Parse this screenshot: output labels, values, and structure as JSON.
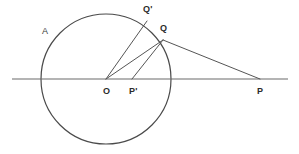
{
  "figure": {
    "background_color": "#ffffff",
    "stroke_color": "#555555",
    "circle_color": "#4a4a4a",
    "axis_color": "#6b6b6b",
    "label_color": "#2b2b2b"
  },
  "labels": {
    "circle_label": "A",
    "center": "O",
    "inverse_point": "P'",
    "exterior_point": "P",
    "tangent_point": "Q",
    "upper_point": "Q'"
  },
  "chart_data": {
    "type": "diagram",
    "xlabel": "",
    "ylabel": "",
    "xlim": [
      0,
      299
    ],
    "ylim": [
      0,
      154
    ],
    "grid": false,
    "legend": "none",
    "circles": [
      {
        "name": "A",
        "center_label": "O",
        "cx": 106,
        "cy": 79,
        "r": 65,
        "stroke": "#4a4a4a"
      }
    ],
    "points": [
      {
        "label": "A",
        "x": 48,
        "y": 35,
        "kind": "circle-name",
        "label_dx": -6,
        "label_dy": -4
      },
      {
        "label": "O",
        "x": 106,
        "y": 79,
        "kind": "center",
        "label_dx": -3,
        "label_dy": 12
      },
      {
        "label": "P'",
        "x": 132,
        "y": 79,
        "kind": "inverse-point",
        "label_dx": -3,
        "label_dy": 12
      },
      {
        "label": "P",
        "x": 260,
        "y": 79,
        "kind": "exterior-point",
        "label_dx": -3,
        "label_dy": 12
      },
      {
        "label": "Q",
        "x": 163,
        "y": 40,
        "kind": "on-circle",
        "label_dx": -3,
        "label_dy": -12
      },
      {
        "label": "Q'",
        "x": 147,
        "y": 21,
        "kind": "on-circle",
        "label_dx": -4,
        "label_dy": -12
      }
    ],
    "segments": [
      {
        "name": "horizontal-axis",
        "x1": 12,
        "y1": 79,
        "x2": 288,
        "y2": 79,
        "style": "axis"
      },
      {
        "name": "O-to-Q-prime",
        "x1": 106,
        "y1": 79,
        "x2": 147,
        "y2": 21,
        "style": "line"
      },
      {
        "name": "O-to-Q",
        "x1": 106,
        "y1": 79,
        "x2": 163,
        "y2": 40,
        "style": "line"
      },
      {
        "name": "P-prime-to-Q",
        "x1": 132,
        "y1": 79,
        "x2": 163,
        "y2": 40,
        "style": "line"
      },
      {
        "name": "Q-to-P",
        "x1": 163,
        "y1": 40,
        "x2": 260,
        "y2": 79,
        "style": "line"
      }
    ]
  }
}
